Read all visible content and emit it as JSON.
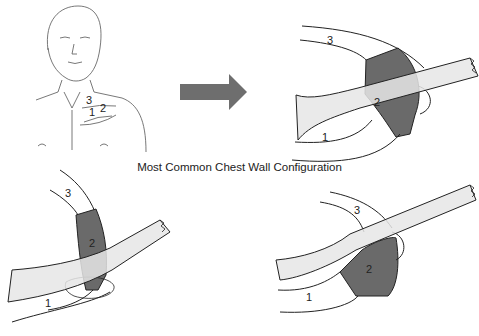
{
  "figure": {
    "caption": "Most Common Chest Wall Configuration",
    "panels": [
      {
        "id": "patient-sketch",
        "labels": [
          "3",
          "2",
          "1"
        ]
      },
      {
        "id": "top-right",
        "labels": {
          "rib_upper": "3",
          "cartilage": "2",
          "rib_lower": "1"
        }
      },
      {
        "id": "bottom-left",
        "labels": {
          "rib_upper": "3",
          "cartilage": "2",
          "rib_lower": "1"
        }
      },
      {
        "id": "bottom-right",
        "labels": {
          "rib_upper": "3",
          "cartilage": "2",
          "rib_lower": "1"
        }
      }
    ],
    "colors": {
      "arrow": "#6e6e6e",
      "cartilage": "#6a6a6a",
      "band": "#e6e6e6",
      "line": "#222222"
    }
  }
}
